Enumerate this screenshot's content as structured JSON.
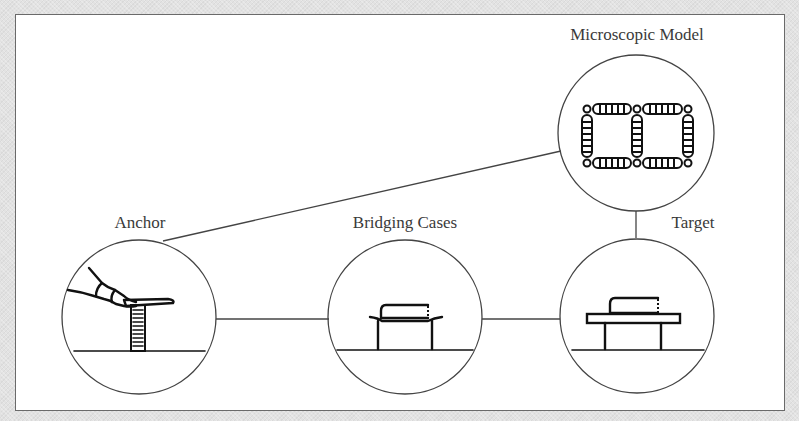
{
  "diagram": {
    "type": "concept-progression",
    "nodes": [
      {
        "id": "anchor",
        "label": "Anchor",
        "depiction": "finger pressing down on a plate resting on a spring"
      },
      {
        "id": "bridging",
        "label": "Bridging Cases",
        "depiction": "book resting on a flexible sheet supported by two legs"
      },
      {
        "id": "target",
        "label": "Target",
        "depiction": "book resting on a rigid table"
      },
      {
        "id": "micro",
        "label": "Microscopic Model",
        "depiction": "lattice of atoms connected by springs"
      }
    ],
    "edges": [
      {
        "from": "anchor",
        "to": "bridging"
      },
      {
        "from": "bridging",
        "to": "target"
      },
      {
        "from": "anchor",
        "to": "micro"
      },
      {
        "from": "micro",
        "to": "target"
      }
    ]
  },
  "labels": {
    "anchor": "Anchor",
    "bridging": "Bridging Cases",
    "target": "Target",
    "micro": "Microscopic Model"
  },
  "colors": {
    "frame_border": "#6a6a6a",
    "line": "#444444",
    "ink": "#111111",
    "background": "#ffffff"
  }
}
